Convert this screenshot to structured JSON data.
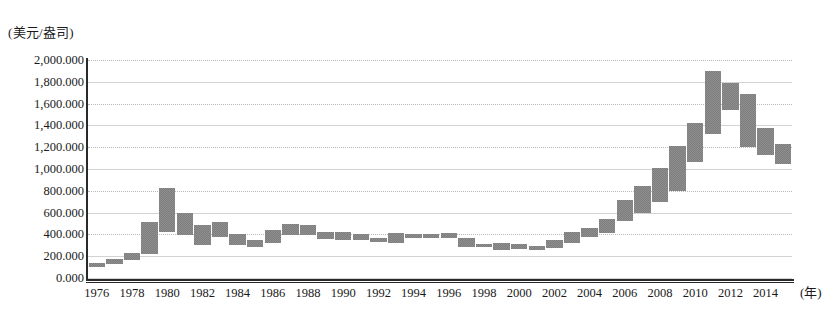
{
  "chart_data": {
    "type": "bar",
    "subtype": "floating-range-bar",
    "title": "",
    "subtitle": "",
    "xlabel": "(年)",
    "ylabel": "(美元/盎司)",
    "ylim": [
      0,
      2000
    ],
    "y_ticks": [
      "0.000",
      "200.000",
      "400.000",
      "600.000",
      "800.000",
      "1,000.000",
      "1,200.000",
      "1,400.000",
      "1,600.000",
      "1,800.000",
      "2,000.000"
    ],
    "y_tick_values": [
      0,
      200,
      400,
      600,
      800,
      1000,
      1200,
      1400,
      1600,
      1800,
      2000
    ],
    "x_tick_labels": [
      "1976",
      "1978",
      "1980",
      "1982",
      "1984",
      "1986",
      "1988",
      "1990",
      "1992",
      "1994",
      "1996",
      "1998",
      "2000",
      "2002",
      "2004",
      "2006",
      "2008",
      "2010",
      "2012",
      "2014"
    ],
    "x_tick_values": [
      1976,
      1978,
      1980,
      1982,
      1984,
      1986,
      1988,
      1990,
      1992,
      1994,
      1996,
      1998,
      2000,
      2002,
      2004,
      2006,
      2008,
      2010,
      2012,
      2014
    ],
    "grid": true,
    "legend": "none",
    "bar_color": "#7d7d7d",
    "categories": [
      1976,
      1977,
      1978,
      1979,
      1980,
      1981,
      1982,
      1983,
      1984,
      1985,
      1986,
      1987,
      1988,
      1989,
      1990,
      1991,
      1992,
      1993,
      1994,
      1995,
      1996,
      1997,
      1998,
      1999,
      2000,
      2001,
      2002,
      2003,
      2004,
      2005,
      2006,
      2007,
      2008,
      2009,
      2010,
      2011,
      2012,
      2013,
      2014,
      2015
    ],
    "series": [
      {
        "name": "年度最低价",
        "values": [
          103,
          130,
          165,
          220,
          420,
          390,
          300,
          375,
          305,
          285,
          325,
          390,
          395,
          360,
          350,
          345,
          330,
          325,
          370,
          370,
          365,
          285,
          280,
          255,
          265,
          255,
          275,
          320,
          375,
          410,
          520,
          600,
          700,
          800,
          1060,
          1320,
          1540,
          1200,
          1130,
          1050
        ]
      },
      {
        "name": "年度最高价",
        "values": [
          140,
          170,
          230,
          510,
          830,
          600,
          490,
          510,
          400,
          345,
          440,
          500,
          485,
          420,
          420,
          405,
          370,
          410,
          400,
          400,
          415,
          370,
          315,
          325,
          315,
          295,
          350,
          420,
          455,
          540,
          720,
          840,
          1010,
          1210,
          1420,
          1900,
          1790,
          1690,
          1380,
          1230
        ]
      }
    ]
  }
}
